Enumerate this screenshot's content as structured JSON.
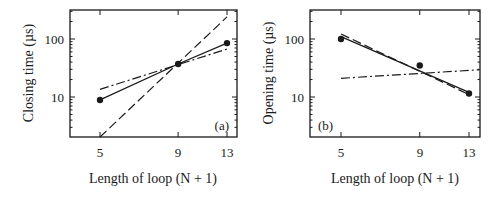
{
  "chart_data": [
    {
      "type": "line",
      "panel_label": "(a)",
      "title": "",
      "xlabel": "Length of loop (N + 1)",
      "ylabel": "Closing time (µs)",
      "xscale": "log",
      "yscale": "log",
      "x_ticks": [
        5,
        9,
        13
      ],
      "y_tick_labels": [
        "10",
        "100"
      ],
      "ylim": [
        2,
        316
      ],
      "xlim": [
        4.2,
        14
      ],
      "grid": false,
      "legend": null,
      "points": {
        "x": [
          5,
          9,
          13
        ],
        "y": [
          8.9,
          37,
          85
        ]
      },
      "series": [
        {
          "name": "data",
          "style": "markers",
          "x": [
            5,
            9,
            13
          ],
          "y": [
            8.9,
            37,
            85
          ]
        },
        {
          "name": "solid fit",
          "style": "solid",
          "x": [
            5,
            9,
            13
          ],
          "y": [
            8.9,
            37,
            85
          ]
        },
        {
          "name": "dash-dot",
          "style": "dashdot",
          "x": [
            5,
            13
          ],
          "y": [
            13.5,
            67
          ]
        },
        {
          "name": "dashed",
          "style": "dashed",
          "x": [
            5,
            13
          ],
          "y": [
            2.0,
            240
          ]
        }
      ]
    },
    {
      "type": "line",
      "panel_label": "(b)",
      "title": "",
      "xlabel": "Length of loop (N + 1)",
      "ylabel": "Opening time (µs)",
      "xscale": "log",
      "yscale": "log",
      "x_ticks": [
        5,
        9,
        13
      ],
      "y_tick_labels": [
        "10",
        "100"
      ],
      "ylim": [
        2,
        316
      ],
      "xlim": [
        4.2,
        14
      ],
      "grid": false,
      "legend": null,
      "points": {
        "x": [
          5,
          9,
          13
        ],
        "y": [
          100,
          35,
          11.5
        ]
      },
      "series": [
        {
          "name": "data",
          "style": "markers",
          "x": [
            5,
            9,
            13
          ],
          "y": [
            100,
            35,
            11.5
          ]
        },
        {
          "name": "solid fit",
          "style": "solid",
          "x": [
            5,
            13
          ],
          "y": [
            110,
            12
          ]
        },
        {
          "name": "dashed",
          "style": "dashed",
          "x": [
            5,
            13
          ],
          "y": [
            122,
            11
          ]
        },
        {
          "name": "dash-dot",
          "style": "dashdot",
          "x": [
            5,
            14
          ],
          "y": [
            21,
            29.5
          ]
        }
      ]
    }
  ],
  "panels": [
    {
      "ylabel": "Closing time (µs)",
      "xlabel": "Length of loop (N + 1)",
      "panel_label": "(a)",
      "xticks": [
        "5",
        "9",
        "13"
      ],
      "yticks": [
        "10",
        "100"
      ]
    },
    {
      "ylabel": "Opening time (µs)",
      "xlabel": "Length of loop (N + 1)",
      "panel_label": "(b)",
      "xticks": [
        "5",
        "9",
        "13"
      ],
      "yticks": [
        "10",
        "100"
      ]
    }
  ],
  "colors": {
    "ink": "#1a1a1a",
    "background": "#ffffff"
  }
}
